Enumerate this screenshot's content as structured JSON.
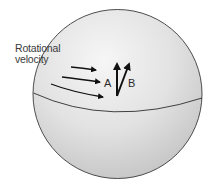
{
  "figure": {
    "title_label_line1": "Rotational",
    "title_label_line2": "velocity",
    "vector_a_label": "A",
    "vector_b_label": "B"
  },
  "colors": {
    "sphere_fill_light": "#f2f2f2",
    "sphere_fill_dark": "#c8c8c8",
    "outline": "#3a3a3a",
    "arrow": "#111111",
    "text": "#3a3a3a"
  }
}
